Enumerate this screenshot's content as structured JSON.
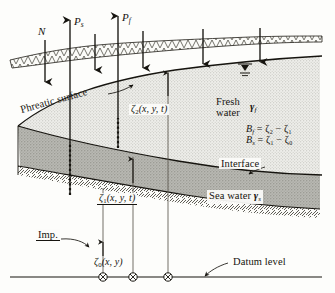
{
  "figure": {
    "domain": "hydrogeology-cross-section",
    "width": 335,
    "height": 293
  },
  "flux_labels": {
    "natural_replenishment": "N",
    "sea_water_pumping": "P",
    "sea_water_pumping_sub": "s",
    "fresh_water_pumping": "P",
    "fresh_water_pumping_sub": "f"
  },
  "surfaces": {
    "phreatic": "Phreatic surface",
    "interface": "Interface",
    "impervious": "Imp.",
    "datum": "Datum level"
  },
  "zones": {
    "fresh_water_line1": "Fresh",
    "fresh_water_line2": "water",
    "fresh_water_gamma": "γ",
    "fresh_water_gamma_sub": "f",
    "sea_water": "Sea water",
    "sea_water_gamma": "γ",
    "sea_water_gamma_sub": "s"
  },
  "elevations": {
    "zeta2": "ζ",
    "zeta2_sub": "2",
    "zeta2_args": "(x, y, t)",
    "zeta1": "ζ",
    "zeta1_sub": "1",
    "zeta1_args": "(x, y, t)",
    "zeta0": "ζ",
    "zeta0_sub": "0",
    "zeta0_args": "(x, y)"
  },
  "equations": {
    "thickness_fresh": "B",
    "thickness_fresh_sub": "f",
    "thickness_fresh_rhs": " = ζ₂ − ζ₁",
    "thickness_sea": "B",
    "thickness_sea_sub": "s",
    "thickness_sea_rhs": " = ζ₁ − ζ₀"
  },
  "colors": {
    "fresh_fill": "#e9e9e6",
    "sea_fill": "#b3b3ad",
    "line": "#1a1814",
    "paper": "#fdfdfb",
    "ground_fill": "#f2f2ee"
  },
  "icons": {
    "water_table": "water-table-triangle-icon",
    "well": "well-circle-cross-icon",
    "arrow_down": "arrow-down-icon",
    "arrow_up": "arrow-up-icon"
  }
}
